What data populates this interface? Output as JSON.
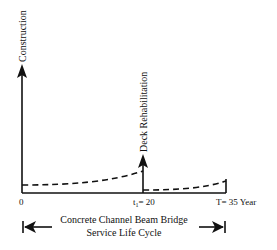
{
  "diagram": {
    "title": "Concrete Channel Beam Bridge",
    "subtitle": "Service Life Cycle",
    "events": [
      {
        "label": "Construction",
        "time": 0
      },
      {
        "label": "Deck Rehabilitation",
        "time": 20
      }
    ],
    "ticks": {
      "start": "0",
      "mid": "t",
      "mid_sub": "1",
      "mid_value": "= 20",
      "end": "T= 35 Year"
    }
  }
}
